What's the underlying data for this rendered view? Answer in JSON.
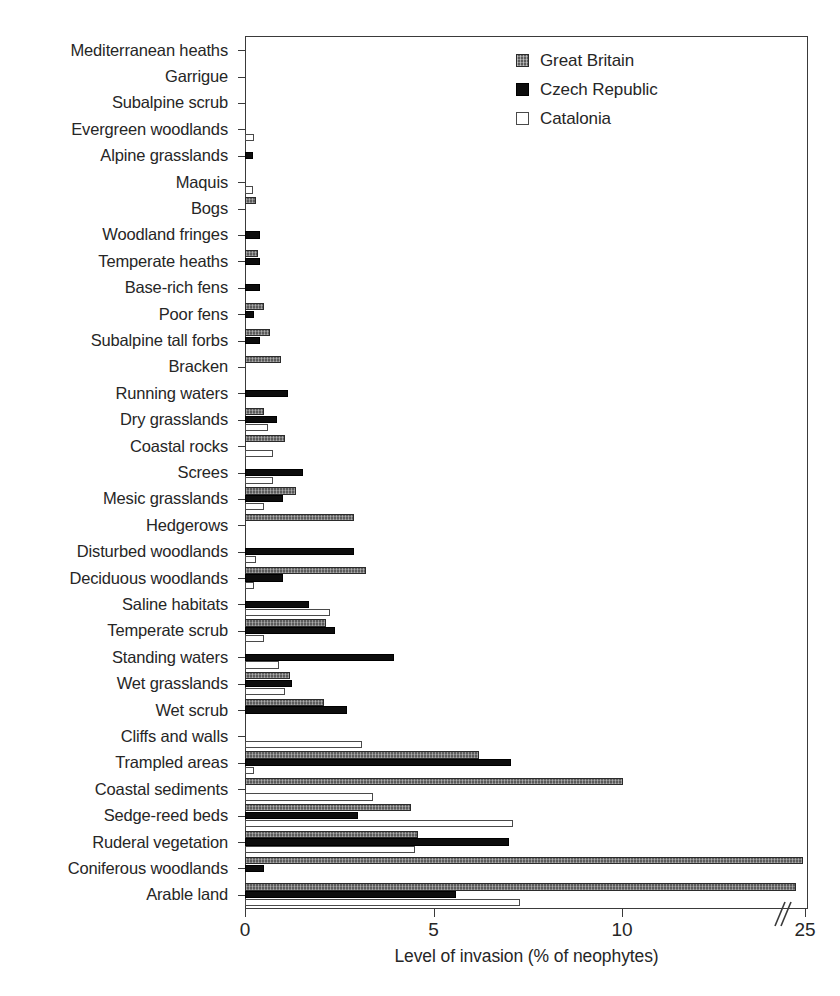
{
  "chart_data": {
    "type": "bar",
    "orientation": "horizontal",
    "title": "",
    "xlabel": "Level of invasion (% of neophytes)",
    "ylabel": "",
    "xlim": [
      0,
      25
    ],
    "x_ticks": [
      0,
      5,
      10,
      25
    ],
    "x_tick_labels": [
      "0",
      "5",
      "10",
      "25"
    ],
    "axis_break": true,
    "axis_break_after": 10,
    "grid": false,
    "legend_position": "top-right",
    "categories": [
      "Mediterranean heaths",
      "Garrigue",
      "Subalpine scrub",
      "Evergreen woodlands",
      "Alpine grasslands",
      "Maquis",
      "Bogs",
      "Woodland fringes",
      "Temperate heaths",
      "Base-rich fens",
      "Poor fens",
      "Subalpine tall forbs",
      "Bracken",
      "Running waters",
      "Dry grasslands",
      "Coastal rocks",
      "Screes",
      "Mesic grasslands",
      "Hedgerows",
      "Disturbed woodlands",
      "Deciduous woodlands",
      "Saline habitats",
      "Temperate scrub",
      "Standing waters",
      "Wet grasslands",
      "Wet scrub",
      "Cliffs and walls",
      "Trampled areas",
      "Coastal sediments",
      "Sedge-reed beds",
      "Ruderal vegetation",
      "Coniferous woodlands",
      "Arable land"
    ],
    "series": [
      {
        "name": "Great Britain",
        "color": "#5b5b5b",
        "values": [
          0,
          0,
          0,
          0,
          0,
          0,
          0.3,
          0,
          0.35,
          0,
          0.5,
          0.65,
          0.95,
          0,
          0.5,
          1.05,
          0,
          1.35,
          2.9,
          0,
          3.2,
          0,
          2.15,
          0,
          1.2,
          2.1,
          0,
          6.2,
          10.05,
          4.4,
          4.6,
          24.8,
          24.3
        ]
      },
      {
        "name": "Czech Republic",
        "color": "#0d0d0d",
        "values": [
          0,
          0,
          0,
          0,
          0.2,
          0,
          0,
          0.4,
          0.4,
          0.4,
          0.25,
          0.4,
          0,
          1.15,
          0.85,
          0,
          1.55,
          1.0,
          0,
          2.9,
          1.0,
          1.7,
          2.4,
          3.95,
          1.25,
          2.7,
          0,
          7.05,
          0,
          3.0,
          7.0,
          0.5,
          5.6
        ]
      },
      {
        "name": "Catalonia",
        "color": "#ffffff",
        "values": [
          0,
          0,
          0,
          0.25,
          0,
          0.2,
          0,
          0,
          0,
          0,
          0,
          0,
          0,
          0,
          0.6,
          0.75,
          0.75,
          0.5,
          0,
          0.3,
          0.25,
          2.25,
          0.5,
          0.9,
          1.05,
          0,
          3.1,
          0.25,
          3.4,
          7.1,
          4.5,
          0,
          7.3
        ]
      }
    ]
  },
  "legend": {
    "items": [
      {
        "label": "Great Britain",
        "swatch": "gb-hatched-square-icon"
      },
      {
        "label": "Czech Republic",
        "swatch": "cz-black-square-icon"
      },
      {
        "label": "Catalonia",
        "swatch": "cat-open-square-icon"
      }
    ]
  }
}
